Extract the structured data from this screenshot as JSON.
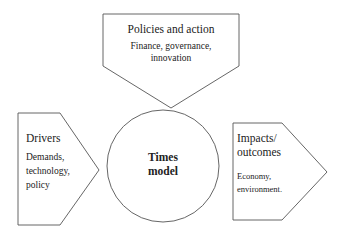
{
  "diagram": {
    "center": {
      "title_line1": "Times",
      "title_line2": "model"
    },
    "top": {
      "title": "Policies and action",
      "sub_line1": "Finance, governance,",
      "sub_line2": "innovation"
    },
    "left": {
      "title": "Drivers",
      "sub_line1": "Demands,",
      "sub_line2": "technology,",
      "sub_line3": "policy"
    },
    "right": {
      "title_line1": "Impacts/",
      "title_line2": "outcomes",
      "sub_line1": "Economy,",
      "sub_line2": "environment."
    },
    "colors": {
      "stroke": "#555555",
      "fill": "#ffffff",
      "text": "#222222"
    }
  }
}
